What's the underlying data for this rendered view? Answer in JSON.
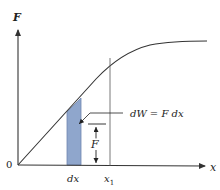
{
  "diagram": {
    "axes": {
      "y_label": "F",
      "x_label": "x",
      "origin_label": "0"
    },
    "annotations": {
      "strip_label": "dx",
      "position_label": "x",
      "position_subscript": "1",
      "force_label": "F",
      "work_equation": "dW = F dx"
    },
    "colors": {
      "strip_fill": "#8fa6cc",
      "strip_edge": "#6f86b0",
      "line": "#333333"
    }
  }
}
